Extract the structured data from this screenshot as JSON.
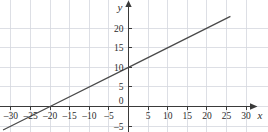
{
  "chart_data": {
    "type": "line",
    "title": "",
    "subtitle": "",
    "xlabel": "x",
    "ylabel": "y",
    "xlim": [
      -33,
      33
    ],
    "ylim": [
      -6,
      23
    ],
    "grid": true,
    "grid_step": 5,
    "legend": "none",
    "equation": "y = 0.5x + 10",
    "slope": 0.5,
    "y_intercept": 10,
    "x_intercept": -20,
    "series": [
      {
        "name": "line",
        "points": [
          {
            "x": -32,
            "y": -6
          },
          {
            "x": -20,
            "y": 0
          },
          {
            "x": 0,
            "y": 10
          },
          {
            "x": 26,
            "y": 23
          }
        ]
      }
    ],
    "x_ticks": [
      {
        "value": -30,
        "label": "–30"
      },
      {
        "value": -25,
        "label": "–25"
      },
      {
        "value": -20,
        "label": "–20"
      },
      {
        "value": -15,
        "label": "–15"
      },
      {
        "value": -10,
        "label": "–10"
      },
      {
        "value": -5,
        "label": "–5"
      },
      {
        "value": 5,
        "label": "5"
      },
      {
        "value": 10,
        "label": "10"
      },
      {
        "value": 15,
        "label": "15"
      },
      {
        "value": 20,
        "label": "20"
      },
      {
        "value": 25,
        "label": "25"
      },
      {
        "value": 30,
        "label": "30"
      }
    ],
    "y_ticks": [
      {
        "value": 20,
        "label": "20"
      },
      {
        "value": 15,
        "label": "15"
      },
      {
        "value": 10,
        "label": "10"
      },
      {
        "value": 5,
        "label": "5"
      },
      {
        "value": -5,
        "label": "–5"
      }
    ],
    "origin_label": "0",
    "colors": {
      "grid": "#d4d7de",
      "axis": "#3a3a3a",
      "line": "#4a4a4a",
      "text": "#2b2b2b",
      "background": "#ffffff"
    }
  }
}
